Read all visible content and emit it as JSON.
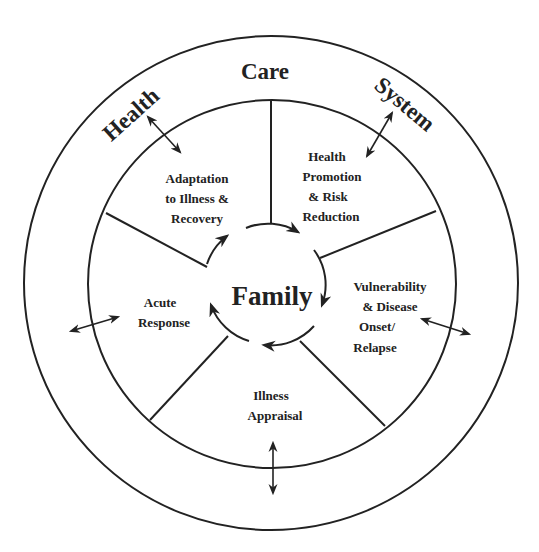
{
  "diagram": {
    "outer_ring": {
      "words": [
        "Health",
        "Care",
        "System"
      ]
    },
    "center": {
      "label": "Family"
    },
    "segments": [
      {
        "id": "adaptation",
        "lines": [
          "Adaptation",
          "to Illness &",
          "Recovery"
        ]
      },
      {
        "id": "health-promotion",
        "lines": [
          "Health",
          "Promotion",
          "& Risk",
          "Reduction"
        ]
      },
      {
        "id": "vulnerability",
        "lines": [
          "Vulnerability",
          "& Disease",
          "Onset/",
          "Relapse"
        ]
      },
      {
        "id": "illness-appraisal",
        "lines": [
          "Illness",
          "Appraisal"
        ]
      },
      {
        "id": "acute-response",
        "lines": [
          "Acute",
          "Response"
        ]
      }
    ],
    "colors": {
      "stroke": "#222222",
      "background": "#ffffff"
    }
  }
}
